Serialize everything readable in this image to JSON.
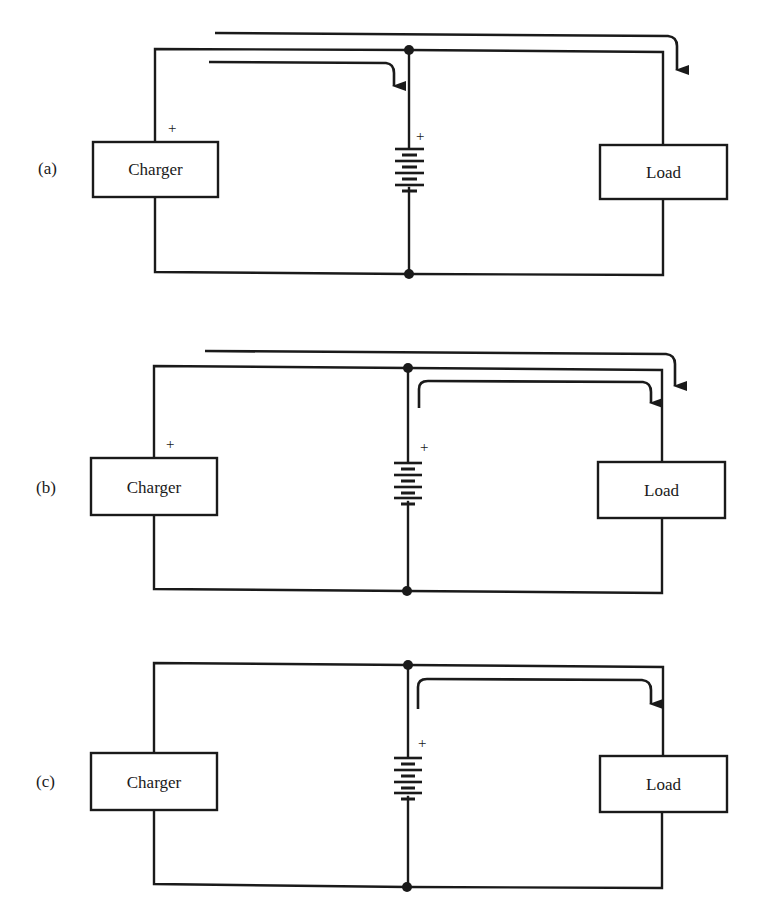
{
  "figure": {
    "panels": [
      {
        "id": "a",
        "label": "(a)",
        "charger_label": "Charger",
        "load_label": "Load",
        "charger_polarity": "+",
        "battery_polarity": "+",
        "current_paths": [
          "charger-to-battery",
          "charger-to-load"
        ]
      },
      {
        "id": "b",
        "label": "(b)",
        "charger_label": "Charger",
        "load_label": "Load",
        "charger_polarity": "+",
        "battery_polarity": "+",
        "current_paths": [
          "charger-to-load",
          "battery-to-load"
        ]
      },
      {
        "id": "c",
        "label": "(c)",
        "charger_label": "Charger",
        "load_label": "Load",
        "charger_polarity": "",
        "battery_polarity": "+",
        "current_paths": [
          "battery-to-load"
        ]
      }
    ],
    "colors": {
      "ink": "#1a1a1a",
      "background": "#ffffff"
    }
  }
}
